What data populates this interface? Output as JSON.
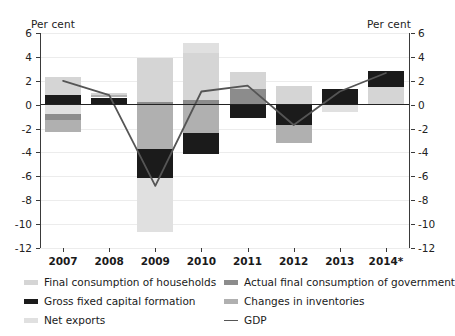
{
  "axis": {
    "unit_label_left": "Per cent",
    "unit_label_right": "Per cent",
    "y_ticks": [
      "6",
      "4",
      "2",
      "0",
      "-2",
      "-4",
      "-6",
      "-8",
      "-10",
      "-12"
    ],
    "x_labels": [
      "2007",
      "2008",
      "2009",
      "2010",
      "2011",
      "2012",
      "2013",
      "2014*"
    ]
  },
  "legend": {
    "items": [
      {
        "label": "Final consumption of households",
        "color": "#d5d5d5",
        "kind": "swatch"
      },
      {
        "label": "Actual final consumption of government",
        "color": "#8c8c8c",
        "kind": "swatch"
      },
      {
        "label": "Gross fixed capital formation",
        "color": "#1b1b1b",
        "kind": "swatch"
      },
      {
        "label": "Changes in inventories",
        "color": "#b0b0b0",
        "kind": "swatch"
      },
      {
        "label": "Net exports",
        "color": "#e0e0e0",
        "kind": "swatch"
      },
      {
        "label": "GDP",
        "color": "#555555",
        "kind": "line"
      }
    ]
  },
  "chart_data": {
    "type": "bar",
    "subtype": "stacked-bar-with-line",
    "title": "",
    "subtitle": "",
    "xlabel": "",
    "ylabel": "Per cent",
    "ylim": [
      -12,
      6
    ],
    "ytick_step": 2,
    "grid": true,
    "legend_position": "bottom",
    "categories": [
      "2007",
      "2008",
      "2009",
      "2010",
      "2011",
      "2012",
      "2013",
      "2014*"
    ],
    "series": [
      {
        "name": "Final consumption of households",
        "color": "#d5d5d5",
        "values": [
          1.5,
          0.3,
          3.7,
          2.6,
          1.4,
          1.55,
          0.0,
          1.5
        ]
      },
      {
        "name": "Actual final consumption of government",
        "color": "#8c8c8c",
        "values": [
          -0.5,
          0.1,
          0.2,
          1.3,
          1.3,
          0.0,
          0.0,
          0.0
        ]
      },
      {
        "name": "Gross fixed capital formation",
        "color": "#1b1b1b",
        "values": [
          0.8,
          0.6,
          -2.4,
          -1.7,
          -1.1,
          -1.7,
          1.35,
          1.35
        ]
      },
      {
        "name": "Changes in inventories",
        "color": "#b0b0b0",
        "values": [
          -0.5,
          0.2,
          -3.7,
          -1.7,
          0.0,
          -1.5,
          0.0,
          0.0
        ]
      },
      {
        "name": "Net exports",
        "color": "#e0e0e0",
        "values": [
          -0.8,
          0.1,
          -4.6,
          0.9,
          0.0,
          0.0,
          -0.6,
          0.0
        ]
      }
    ],
    "line_series": {
      "name": "GDP",
      "color": "#555555",
      "values": [
        2.0,
        0.8,
        -6.8,
        1.1,
        1.6,
        -1.7,
        1.1,
        2.65
      ]
    },
    "stack_segments": {
      "2007": [
        {
          "series": "Gross fixed capital formation",
          "from": 0.0,
          "to": 0.8,
          "color": "#1b1b1b"
        },
        {
          "series": "Final consumption of households",
          "from": 0.8,
          "to": 2.3,
          "color": "#d5d5d5"
        },
        {
          "series": "Net exports",
          "from": 0.0,
          "to": -0.8,
          "color": "#e0e0e0"
        },
        {
          "series": "Actual final consumption of government",
          "from": -0.8,
          "to": -1.3,
          "color": "#8c8c8c"
        },
        {
          "series": "Changes in inventories",
          "from": -1.3,
          "to": -2.3,
          "color": "#b0b0b0"
        }
      ],
      "2008": [
        {
          "series": "Gross fixed capital formation",
          "from": 0.0,
          "to": 0.6,
          "color": "#1b1b1b"
        },
        {
          "series": "Changes in inventories",
          "from": 0.6,
          "to": 0.8,
          "color": "#b0b0b0"
        },
        {
          "series": "Final consumption of households",
          "from": 0.8,
          "to": 0.95,
          "color": "#d5d5d5"
        }
      ],
      "2009": [
        {
          "series": "Actual final consumption of government",
          "from": 0.0,
          "to": 0.2,
          "color": "#8c8c8c"
        },
        {
          "series": "Final consumption of households",
          "from": 0.2,
          "to": 3.9,
          "color": "#d5d5d5"
        },
        {
          "series": "Changes in inventories",
          "from": 0.0,
          "to": -3.7,
          "color": "#b0b0b0"
        },
        {
          "series": "Gross fixed capital formation",
          "from": -3.7,
          "to": -6.1,
          "color": "#1b1b1b"
        },
        {
          "series": "Net exports",
          "from": -6.1,
          "to": -10.7,
          "color": "#e0e0e0"
        }
      ],
      "2010": [
        {
          "series": "Actual final consumption of government",
          "from": 0.0,
          "to": 0.4,
          "color": "#8c8c8c"
        },
        {
          "series": "Final consumption of households",
          "from": 0.4,
          "to": 4.3,
          "color": "#d5d5d5"
        },
        {
          "series": "Net exports",
          "from": 4.3,
          "to": 5.2,
          "color": "#e0e0e0"
        },
        {
          "series": "Changes in inventories",
          "from": 0.0,
          "to": -2.4,
          "color": "#b0b0b0"
        },
        {
          "series": "Gross fixed capital formation",
          "from": -2.4,
          "to": -4.1,
          "color": "#1b1b1b"
        }
      ],
      "2011": [
        {
          "series": "Actual final consumption of government",
          "from": 0.0,
          "to": 1.3,
          "color": "#8c8c8c"
        },
        {
          "series": "Final consumption of households",
          "from": 1.3,
          "to": 2.7,
          "color": "#d5d5d5"
        },
        {
          "series": "Gross fixed capital formation",
          "from": 0.0,
          "to": -1.1,
          "color": "#1b1b1b"
        }
      ],
      "2012": [
        {
          "series": "Final consumption of households",
          "from": 0.0,
          "to": 1.55,
          "color": "#d5d5d5"
        },
        {
          "series": "Gross fixed capital formation",
          "from": 0.0,
          "to": -1.7,
          "color": "#1b1b1b"
        },
        {
          "series": "Changes in inventories",
          "from": -1.7,
          "to": -3.2,
          "color": "#b0b0b0"
        }
      ],
      "2013": [
        {
          "series": "Gross fixed capital formation",
          "from": 0.0,
          "to": 1.35,
          "color": "#1b1b1b"
        },
        {
          "series": "Net exports",
          "from": 0.0,
          "to": -0.6,
          "color": "#e0e0e0"
        }
      ],
      "2014*": [
        {
          "series": "Final consumption of households",
          "from": 0.0,
          "to": 1.5,
          "color": "#d5d5d5"
        },
        {
          "series": "Gross fixed capital formation",
          "from": 1.5,
          "to": 2.85,
          "color": "#1b1b1b"
        }
      ]
    }
  }
}
